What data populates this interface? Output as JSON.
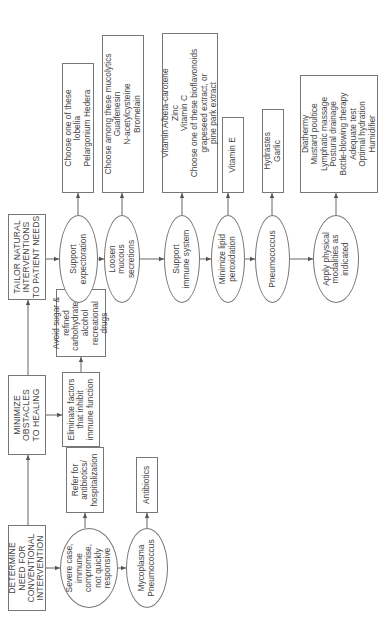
{
  "diagram": {
    "orientation": "rotated-90-ccw",
    "headers": {
      "determine": "DETERMINE\nNEED FOR\nCONVENTIONAL\nINTERVENTION",
      "minimize": "MINIMIZE\nOBSTACLES\nTO HEALING",
      "tailor": "TAILOR NATURAL\nINTERVENTIONS\nTO PATIENT NEEDS"
    },
    "conventional": {
      "severe_case": "Severe case,\nimmune compromise,\nnot quickly\nresponsive",
      "refer": "Refer for\nantibiotics/\nhospitalization",
      "mycoplasma": "Mycoplasma\nPneumococcus",
      "antibiotics": "Antibiotics"
    },
    "obstacles": {
      "eliminate": "Eliminate factors\nthat inhibit\nimmune function",
      "avoid": "Avoid sugar &\nrefined\ncarbohydrates,\nalcohol\nrecreational drugs"
    },
    "natural": [
      {
        "condition": "Support\nexpectoration",
        "treatment": "Choose one of these\nlobelia\nPelargonium Hedera"
      },
      {
        "condition": "Loosen\nmucous\nsecretions",
        "treatment": "Choose among these mucolytics\nGuaifenesin\nN-acetylcysteine\nBromelain"
      },
      {
        "condition": "Support\nimmune system",
        "treatment": "Vitamin A/beta-carotene\nZinc\nVitamin C\nChoose one of these bioflavonoids\ngrapeseed extract, or\npine park extract"
      },
      {
        "condition": "Minimize lipid\nperoxidation",
        "treatment": "Vitamin E"
      },
      {
        "condition": "Pneumococcus",
        "treatment": "Hydrastes\nGarlic"
      },
      {
        "condition": "Apply physical\nmodalities as\nindicated",
        "treatment": "Diathermy\nMustard poultice\nLymphatic massage\nPostural drainage\nBottle-blowing therapy\nAdequate test\nOptimal hydration\nHumidifier"
      }
    ]
  }
}
